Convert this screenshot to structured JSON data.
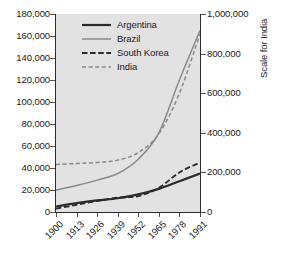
{
  "chart_data": {
    "type": "line",
    "title": "",
    "xlabel": "",
    "ylabel": "",
    "ylabel_right": "Scale for India",
    "grid": false,
    "legend_position": "top-center-inside",
    "x": [
      1900,
      1913,
      1926,
      1939,
      1952,
      1965,
      1978,
      1991
    ],
    "xtick_labels": [
      "1900",
      "1913",
      "1926",
      "1939",
      "1952",
      "1965",
      "1978",
      "1991"
    ],
    "ylim": [
      0,
      180000
    ],
    "ytick_labels": [
      "0",
      "20,000",
      "40,000",
      "60,000",
      "80,000",
      "100,000",
      "120,000",
      "140,000",
      "160,000",
      "180,000"
    ],
    "ytick_values": [
      0,
      20000,
      40000,
      60000,
      80000,
      100000,
      120000,
      140000,
      160000,
      180000
    ],
    "ylim_right": [
      0,
      1000000
    ],
    "ytick_labels_right": [
      "0",
      "200,000",
      "400,000",
      "600,000",
      "800,000",
      "1,000,000"
    ],
    "ytick_values_right": [
      0,
      200000,
      400000,
      600000,
      800000,
      1000000
    ],
    "series": [
      {
        "name": "Argentina",
        "axis": "left",
        "color": "#2b2b2b",
        "style": "solid",
        "width": 2.2,
        "values": [
          5000,
          8000,
          10500,
          12500,
          16000,
          21000,
          28000,
          35000
        ]
      },
      {
        "name": "Brazil",
        "axis": "left",
        "color": "#8a8a8a",
        "style": "solid",
        "width": 1.5,
        "values": [
          20000,
          24000,
          29000,
          35000,
          48000,
          72000,
          120000,
          165000
        ]
      },
      {
        "name": "South Korea",
        "axis": "left",
        "color": "#2b2b2b",
        "style": "dashed",
        "width": 1.8,
        "values": [
          3000,
          6500,
          10000,
          13000,
          14500,
          22000,
          36000,
          45000
        ]
      },
      {
        "name": "India",
        "axis": "right",
        "color": "#8a8a8a",
        "style": "dashed",
        "width": 1.5,
        "values": [
          240000,
          245000,
          250000,
          262000,
          300000,
          395000,
          600000,
          900000
        ]
      }
    ]
  },
  "legend": {
    "items": [
      {
        "label": "Argentina"
      },
      {
        "label": "Brazil"
      },
      {
        "label": "South Korea"
      },
      {
        "label": "India"
      }
    ]
  },
  "axes": {
    "right_title": "Scale for India"
  }
}
